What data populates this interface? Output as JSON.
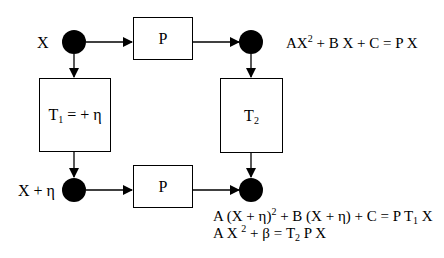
{
  "diagram": {
    "nodes": {
      "top_left": {
        "label": "X"
      },
      "top_right": {},
      "bottom_left": {
        "label": "X + η"
      },
      "bottom_right": {}
    },
    "boxes": {
      "top_p": {
        "label": "P"
      },
      "bottom_p": {
        "label": "P"
      },
      "t1": {
        "main": "T",
        "sub": "1",
        "rest": " = + η"
      },
      "t2": {
        "main": "T",
        "sub": "2"
      }
    },
    "equations": {
      "top": {
        "a": "AX",
        "sup": "2",
        "b": " + B X + C  = P X"
      },
      "bottom_1": {
        "a": "A (X + η)",
        "sup": "2",
        "b": " + B (X + η) + C = P T",
        "sub": "1",
        "c": " X"
      },
      "bottom_2": {
        "a": "A X ",
        "sup": "2",
        "b": " + β = T",
        "sub": "2",
        "c": " P X"
      }
    },
    "colors": {
      "ink": "#000000",
      "background": "#ffffff"
    }
  }
}
